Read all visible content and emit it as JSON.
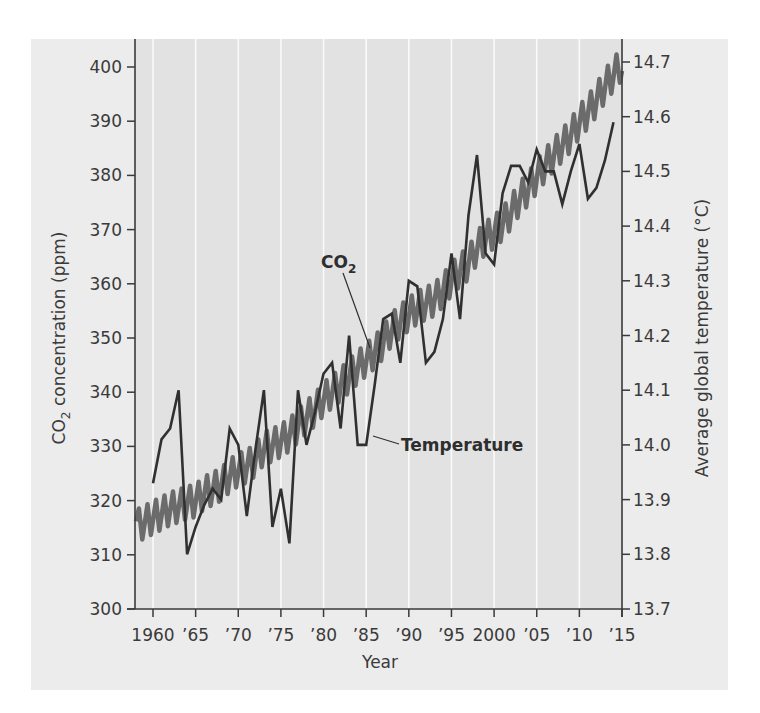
{
  "chart_data": {
    "type": "line",
    "title": "",
    "xlabel": "Year",
    "ylabel_left": "CO2 concentration (ppm)",
    "ylabel_right": "Average global temperature (°C)",
    "xlim": [
      1958,
      2015
    ],
    "ylim_left": [
      300,
      400
    ],
    "ylim_right": [
      13.7,
      14.7
    ],
    "x_ticks": [
      1960,
      1965,
      1970,
      1975,
      1980,
      1985,
      1990,
      1995,
      2000,
      2005,
      2010,
      2015
    ],
    "x_tick_labels": [
      "1960",
      "’65",
      "’70",
      "’75",
      "’80",
      "’85",
      "’90",
      "’95",
      "2000",
      "’05",
      "’10",
      "’15"
    ],
    "y_left_ticks": [
      300,
      310,
      320,
      330,
      340,
      350,
      360,
      370,
      380,
      390,
      400
    ],
    "y_right_ticks": [
      "13.7",
      "13.8",
      "13.9",
      "14.0",
      "14.1",
      "14.2",
      "14.3",
      "14.4",
      "14.5",
      "14.6",
      "14.7"
    ],
    "grid": "vertical white lines at x ticks",
    "legend": "inline labels with leader lines",
    "series": [
      {
        "name": "CO2",
        "label": "CO",
        "label_sub": "2",
        "axis": "left",
        "style": "seasonal sawtooth, thick gray",
        "color": "#6b6b6b",
        "seasonal_amplitude_ppm": 3,
        "x": [
          1958,
          1959,
          1960,
          1961,
          1962,
          1963,
          1964,
          1965,
          1966,
          1967,
          1968,
          1969,
          1970,
          1971,
          1972,
          1973,
          1974,
          1975,
          1976,
          1977,
          1978,
          1979,
          1980,
          1981,
          1982,
          1983,
          1984,
          1985,
          1986,
          1987,
          1988,
          1989,
          1990,
          1991,
          1992,
          1993,
          1994,
          1995,
          1996,
          1997,
          1998,
          1999,
          2000,
          2001,
          2002,
          2003,
          2004,
          2005,
          2006,
          2007,
          2008,
          2009,
          2010,
          2011,
          2012,
          2013,
          2014
        ],
        "values": [
          315.3,
          316.0,
          316.9,
          317.6,
          318.5,
          319.0,
          319.6,
          320.0,
          321.4,
          322.2,
          323.0,
          324.6,
          325.7,
          326.3,
          327.5,
          329.7,
          330.2,
          331.1,
          332.1,
          333.8,
          335.4,
          336.8,
          338.7,
          340.1,
          341.4,
          343.0,
          344.6,
          346.0,
          347.4,
          349.2,
          351.6,
          353.1,
          354.4,
          355.6,
          356.4,
          357.1,
          358.8,
          360.8,
          362.6,
          363.7,
          366.7,
          368.4,
          369.6,
          371.1,
          373.2,
          375.8,
          377.5,
          379.8,
          381.9,
          383.8,
          385.6,
          387.4,
          389.9,
          391.7,
          393.9,
          396.5,
          398.6
        ]
      },
      {
        "name": "Temperature",
        "label": "Temperature",
        "axis": "right",
        "style": "solid dark line",
        "color": "#303030",
        "x": [
          1960,
          1961,
          1962,
          1963,
          1964,
          1965,
          1966,
          1967,
          1968,
          1969,
          1970,
          1971,
          1972,
          1973,
          1974,
          1975,
          1976,
          1977,
          1978,
          1979,
          1980,
          1981,
          1982,
          1983,
          1984,
          1985,
          1986,
          1987,
          1988,
          1989,
          1990,
          1991,
          1992,
          1993,
          1994,
          1995,
          1996,
          1997,
          1998,
          1999,
          2000,
          2001,
          2002,
          2003,
          2004,
          2005,
          2006,
          2007,
          2008,
          2009,
          2010,
          2011,
          2012,
          2013,
          2014
        ],
        "values": [
          13.93,
          14.01,
          14.03,
          14.1,
          13.8,
          13.85,
          13.89,
          13.92,
          13.9,
          14.03,
          14.0,
          13.87,
          13.99,
          14.1,
          13.85,
          13.92,
          13.82,
          14.1,
          14.0,
          14.06,
          14.13,
          14.15,
          14.03,
          14.2,
          14.0,
          14.0,
          14.11,
          14.23,
          14.24,
          14.15,
          14.3,
          14.29,
          14.15,
          14.17,
          14.23,
          14.35,
          14.23,
          14.42,
          14.53,
          14.35,
          14.33,
          14.46,
          14.51,
          14.51,
          14.48,
          14.54,
          14.5,
          14.5,
          14.44,
          14.5,
          14.55,
          14.45,
          14.47,
          14.52,
          14.59
        ]
      }
    ]
  },
  "colors": {
    "panel_background": "#ececec",
    "plot_background": "#e2e2e2",
    "gridline": "#fafafa",
    "axis": "#3a3a3a",
    "co2_line": "#6b6b6b",
    "temperature_line": "#303030"
  }
}
